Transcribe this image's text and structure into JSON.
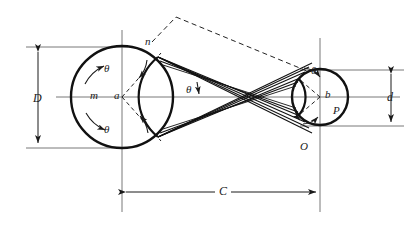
{
  "figure": {
    "type": "crossed-belt-drive-diagram",
    "title": "",
    "colors": {
      "stroke": "#1a1a1a",
      "thin_stroke": "#3a3a3a",
      "background": "#ffffff"
    }
  },
  "pulleys": {
    "large": {
      "name": "driver-pulley",
      "center_label": "a",
      "center_x": 122,
      "center_y": 97,
      "radius": 51,
      "surface_label": "m",
      "tangent_label": "n"
    },
    "small": {
      "name": "driven-pulley",
      "center_label": "b",
      "center_x": 320,
      "center_y": 97,
      "radius": 28,
      "surface_label": "P",
      "tangent_label": "O"
    }
  },
  "dimensions": {
    "large_diameter": {
      "label": "D",
      "x": 38,
      "y_top": 47,
      "y_bottom": 148
    },
    "small_diameter": {
      "label": "d",
      "x": 391,
      "y_top": 70,
      "y_bottom": 126
    },
    "center_distance": {
      "label": "C",
      "y": 192,
      "x_left": 122,
      "x_right": 320
    }
  },
  "angles": [
    {
      "label": "θ",
      "name": "theta-large-upper",
      "x": 104,
      "y": 63
    },
    {
      "label": "θ",
      "name": "theta-large-lower",
      "x": 104,
      "y": 124
    },
    {
      "label": "θ",
      "name": "theta-belt-wedge",
      "x": 186,
      "y": 91
    },
    {
      "label": "θ",
      "name": "theta-small-upper",
      "x": 311,
      "y": 72
    }
  ],
  "point_labels": [
    {
      "text": "m",
      "name": "point-label-m",
      "x": 90,
      "y": 90
    },
    {
      "text": "a",
      "name": "point-label-a",
      "x": 114,
      "y": 90
    },
    {
      "text": "n",
      "name": "point-label-n",
      "x": 145,
      "y": 36
    },
    {
      "text": "b",
      "name": "point-label-b",
      "x": 325,
      "y": 89
    },
    {
      "text": "P",
      "name": "point-label-P",
      "x": 333,
      "y": 105
    },
    {
      "text": "O",
      "name": "point-label-O",
      "x": 300,
      "y": 141
    }
  ]
}
